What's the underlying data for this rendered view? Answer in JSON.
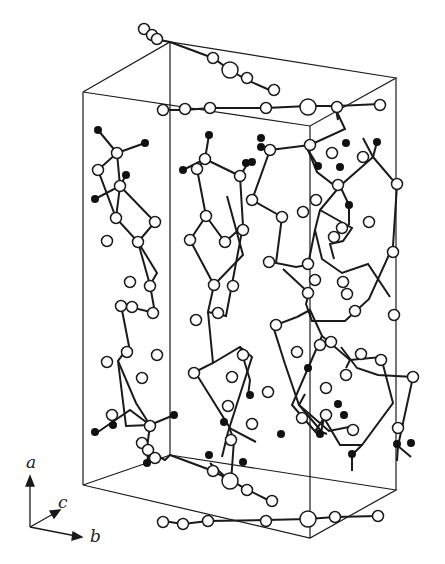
{
  "figure": {
    "type": "crystal-packing-diagram",
    "axes": {
      "a": "a",
      "b": "b",
      "c": "c"
    },
    "colors": {
      "line": "#1a1a1a",
      "atom_open": "#ffffff",
      "atom_filled": "#111111"
    }
  }
}
